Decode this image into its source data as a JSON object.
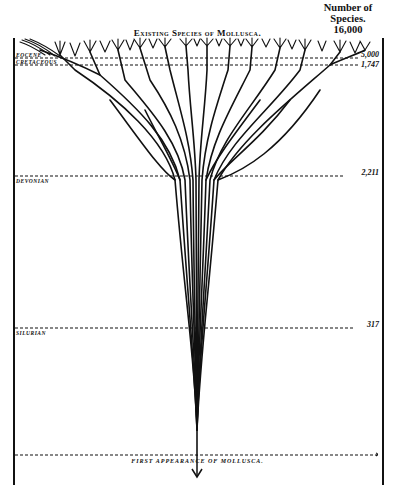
{
  "title": "Existing Species of Mollusca.",
  "count_header": {
    "line1": "Number of",
    "line2": "Species.",
    "line3": "16,000"
  },
  "eras": [
    {
      "name": "EOCENE",
      "count": "5,000",
      "y": 58
    },
    {
      "name": "CRETACEOUS",
      "count": "1,747",
      "y": 65
    },
    {
      "name": "DEVONIAN",
      "count": "2,211",
      "y": 176
    },
    {
      "name": "SILURIAN",
      "count": "317",
      "y": 328
    },
    {
      "name": "FIRST APPEARANCE OF MOLLUSCA.",
      "count": "",
      "y": 455
    }
  ],
  "bottom_label": "FIRST APPEARANCE OF MOLLUSCA.",
  "colors": {
    "ink": "#111111",
    "paper": "#ffffff"
  }
}
